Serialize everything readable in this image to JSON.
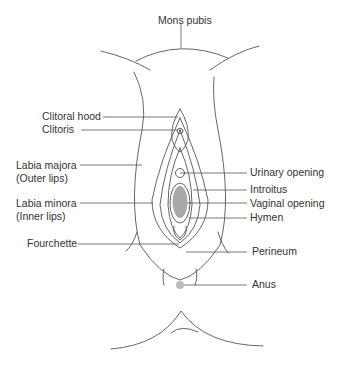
{
  "diagram": {
    "colors": {
      "line": "#555555",
      "text": "#333333",
      "hymen_fill": "#9a9a9a",
      "anus_fill": "#bdbdbd"
    },
    "labels": {
      "mons_pubis": "Mons pubis",
      "clitoral_hood": "Clitoral hood",
      "clitoris": "Clitoris",
      "labia_majora": "Labia majora\n(Outer lips)",
      "labia_minora": "Labia minora\n(Inner lips)",
      "fourchette": "Fourchette",
      "urinary_opening": "Urinary opening",
      "introitus": "Introitus",
      "vaginal_opening": "Vaginal opening",
      "hymen": "Hymen",
      "perineum": "Perineum",
      "anus": "Anus"
    }
  }
}
